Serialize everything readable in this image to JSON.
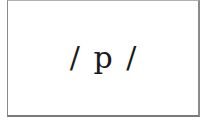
{
  "card": {
    "text": "/ p /"
  }
}
